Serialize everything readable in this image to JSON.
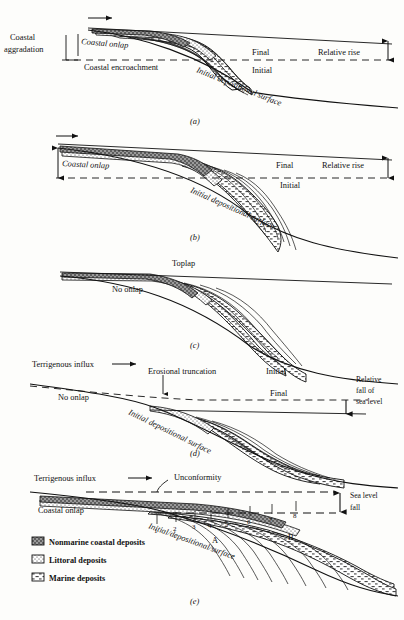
{
  "figure": {
    "type": "geological-stratigraphy-diagram",
    "panel_count": 5
  },
  "panels": [
    {
      "id": "(a)",
      "name": "panel-a",
      "labels": {
        "coastal_aggradation": "Coastal",
        "coastal_aggradation2": "aggradation",
        "coastal_onlap": "Coastal onlap",
        "coastal_encroachment": "Coastal encroachment",
        "final": "Final",
        "initial": "Initial",
        "relative_rise": "Relative rise",
        "initial_depositional_surface": "Initial depositional surface"
      }
    },
    {
      "id": "(b)",
      "name": "panel-b",
      "labels": {
        "coastal_onlap": "Coastal onlap",
        "final": "Final",
        "initial": "Initial",
        "relative_rise": "Relative rise",
        "initial_depositional_surface": "Initial depositional surface"
      }
    },
    {
      "id": "(c)",
      "name": "panel-c",
      "labels": {
        "toplap": "Toplap",
        "no_onlap": "No onlap"
      }
    },
    {
      "id": "(d)",
      "name": "panel-d",
      "labels": {
        "terrigenous_influx": "Terrigenous influx",
        "erosional_truncation": "Erosional truncation",
        "initial": "Initial",
        "final": "Final",
        "no_onlap": "No onlap",
        "relative_fall_line1": "Relative",
        "relative_fall_line2": "fall of",
        "relative_fall_line3": "sea level",
        "initial_depositional_surface": "Initial depositional surface"
      }
    },
    {
      "id": "(e)",
      "name": "panel-e",
      "labels": {
        "terrigenous_influx": "Terrigenous influx",
        "unconformity": "Unconformity",
        "coastal_onlap": "Coastal onlap",
        "sea_level_fall_line1": "Sea level",
        "sea_level_fall_line2": "fall",
        "initial_depositional_surface": "Initial/depositional/surface",
        "marker_A": "A",
        "marker_B": "B"
      },
      "clinoform_numbers": [
        "1",
        "2",
        "3",
        "4",
        "5",
        "6",
        "7",
        "8"
      ]
    }
  ],
  "legend": {
    "name": "deposit-legend",
    "items": [
      {
        "label": "Nonmarine coastal deposits",
        "pattern": "gray-stipple"
      },
      {
        "label": "Littoral deposits",
        "pattern": "fine-dots"
      },
      {
        "label": "Marine deposits",
        "pattern": "dash-hatch"
      }
    ]
  },
  "arrows": {
    "influx_arrow": "→"
  },
  "colors": {
    "ink": "#111111",
    "paper": "#fdfdfb",
    "nonmarine_fill": "#8d8d8d",
    "littoral_fill": "#e8e8e8",
    "marine_fill": "#ffffff"
  }
}
